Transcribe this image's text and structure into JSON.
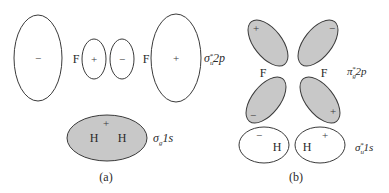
{
  "panel_a": {
    "caption": "(a)",
    "p_orbitals": {
      "left_large_sign": "−",
      "left_atom": "F",
      "left_small_sign": "+",
      "right_small_sign": "−",
      "right_atom": "F",
      "right_large_sign": "+",
      "label_sym": "σ",
      "label_sub": "u",
      "label_sup": "*",
      "label_orbital": "2p"
    },
    "s_orbital": {
      "sign": "+",
      "atom_left": "H",
      "atom_right": "H",
      "label_sym": "σ",
      "label_sub": "g",
      "label_orbital": "1s"
    }
  },
  "panel_b": {
    "caption": "(b)",
    "p_orbitals": {
      "top_left_sign": "+",
      "top_right_sign": "−",
      "bottom_left_sign": "−",
      "bottom_right_sign": "+",
      "atom_left": "F",
      "atom_right": "F",
      "label_sym": "π",
      "label_sub": "g",
      "label_sup": "*",
      "label_orbital": "2p"
    },
    "s_orbitals": {
      "left_sign": "−",
      "right_sign": "+",
      "atom_left": "H",
      "atom_right": "H",
      "label_sym": "σ",
      "label_sub": "u",
      "label_sup": "*",
      "label_orbital": "1s"
    }
  },
  "colors": {
    "shaded_fill": "#c8c8c8",
    "outline": "#3a3a3a"
  }
}
